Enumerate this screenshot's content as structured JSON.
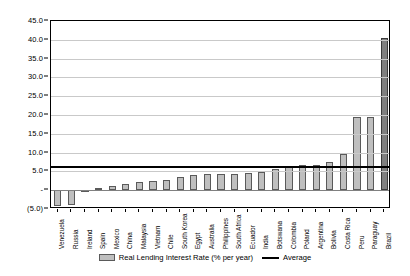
{
  "chart_data": {
    "type": "bar",
    "title": "",
    "xlabel": "",
    "ylabel": "",
    "ylim": [
      -5.0,
      45.0
    ],
    "ytick_step": 5.0,
    "grid": true,
    "legend_position": "bottom",
    "yticks": [
      "45.0",
      "40.0",
      "35.0",
      "30.0",
      "25.0",
      "20.0",
      "15.0",
      "10.0",
      "5.0",
      "-",
      "(5.0)"
    ],
    "ytick_values": [
      45.0,
      40.0,
      35.0,
      30.0,
      25.0,
      20.0,
      15.0,
      10.0,
      5.0,
      0.0,
      -5.0
    ],
    "categories": [
      "Venezuela",
      "Russia",
      "Ireland",
      "Spain",
      "Mexico",
      "China",
      "Malaysia",
      "Vietnam",
      "Chile",
      "South Korea",
      "Egypt",
      "Australia",
      "Philippines",
      "South Africa",
      "Ecuador",
      "India",
      "Botswana",
      "Colombia",
      "Poland",
      "Argentina",
      "Bolivia",
      "Costa Rica",
      "Peru",
      "Paraguay",
      "Brazil"
    ],
    "series": [
      {
        "name": "Real Lending Interest Rate (% per year)",
        "color": "#bfbfbf",
        "values": [
          -4.2,
          -4.0,
          -0.2,
          0.6,
          1.0,
          1.6,
          2.1,
          2.5,
          2.6,
          3.5,
          4.0,
          4.2,
          4.3,
          4.4,
          4.6,
          4.9,
          5.6,
          6.1,
          6.6,
          6.6,
          7.6,
          9.5,
          19.4,
          19.6,
          40.4
        ]
      }
    ],
    "average_line": {
      "name": "Average",
      "value": 6.3,
      "color": "#000000"
    }
  },
  "legend": {
    "bar_label": "Real Lending Interest Rate (% per year)",
    "line_label": "Average"
  }
}
